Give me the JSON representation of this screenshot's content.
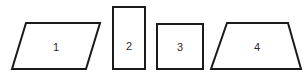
{
  "figure": {
    "background_color": "#ffffff",
    "stroke_color": "#1a1a1a",
    "fill_color": "#ffffff",
    "label_color": "#2b2b2b",
    "stroke_width": 2,
    "canvas": {
      "width": 306,
      "height": 75
    }
  },
  "shapes": [
    {
      "id": "shape-1",
      "label": "1",
      "kind": "parallelogram",
      "points": "26,23 100,23 86,69 12,69",
      "label_x": 56,
      "label_y": 47
    },
    {
      "id": "shape-2",
      "label": "2",
      "kind": "rectangle",
      "points": "113,7 145,7 145,69 113,69",
      "label_x": 129,
      "label_y": 46
    },
    {
      "id": "shape-3",
      "label": "3",
      "kind": "square",
      "points": "157,24 203,24 203,69 157,69",
      "label_x": 180,
      "label_y": 47
    },
    {
      "id": "shape-4",
      "label": "4",
      "kind": "trapezoid",
      "points": "227,23 288,23 301,69 211,69",
      "label_x": 257,
      "label_y": 47
    }
  ]
}
